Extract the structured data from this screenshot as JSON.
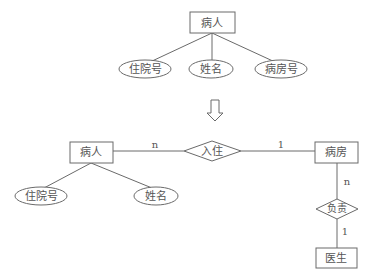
{
  "diagram": {
    "type": "er-diagram",
    "top": {
      "entity": {
        "label": "病人"
      },
      "attributes": [
        {
          "label": "住院号"
        },
        {
          "label": "姓名"
        },
        {
          "label": "病房号"
        }
      ]
    },
    "transform_arrow": "down-arrow",
    "bottom": {
      "entities": {
        "patient": {
          "label": "病人"
        },
        "ward": {
          "label": "病房"
        },
        "doctor": {
          "label": "医生"
        }
      },
      "relationships": {
        "admit": {
          "label": "入住",
          "card_left": "n",
          "card_right": "1"
        },
        "responsible": {
          "label": "负责",
          "card_top": "n",
          "card_bottom": "1"
        }
      },
      "patient_attributes": [
        {
          "label": "住院号"
        },
        {
          "label": "姓名"
        }
      ]
    }
  }
}
